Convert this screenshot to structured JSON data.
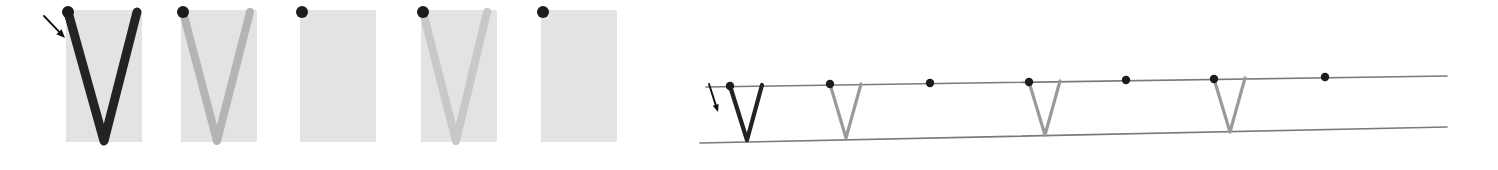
{
  "figure": {
    "caption": "",
    "background": "#ffffff",
    "width": 1498,
    "height": 170
  },
  "palette": {
    "panel_fill": "#e3e3e3",
    "dot_color": "#1c1c1c",
    "stroke_dark": "#232323",
    "stroke_mid": "#9a9a9a",
    "stroke_light": "#c3c3c3",
    "rail_color": "#7a7a7a",
    "arrow_color": "#111111"
  },
  "left_group": {
    "name": "square-panel-strip",
    "panel_count": 5,
    "panel_size": 76,
    "panel_top": 10,
    "panel_gap": 39,
    "panels": [
      {
        "index": 1,
        "x": 66,
        "y": 10,
        "w": 76,
        "h": 132,
        "fill": "#e3e3e3",
        "dot": {
          "cx": 68,
          "cy": 12,
          "r": 6
        },
        "v_shape": {
          "present": true,
          "color": "#232323",
          "width": 9,
          "left_x": 68,
          "right_x": 137,
          "apex_x": 104,
          "top_y": 12,
          "apex_y": 141
        },
        "label": "panel-1-dark-v"
      },
      {
        "index": 2,
        "x": 181,
        "y": 10,
        "w": 76,
        "h": 132,
        "fill": "#e3e3e3",
        "dot": {
          "cx": 183,
          "cy": 12,
          "r": 6
        },
        "v_shape": {
          "present": true,
          "color": "#b4b4b4",
          "width": 8,
          "left_x": 183,
          "right_x": 250,
          "apex_x": 217,
          "top_y": 12,
          "apex_y": 141
        },
        "label": "panel-2-grey-v"
      },
      {
        "index": 3,
        "x": 300,
        "y": 10,
        "w": 76,
        "h": 132,
        "fill": "#e3e3e3",
        "dot": {
          "cx": 302,
          "cy": 12,
          "r": 6
        },
        "v_shape": {
          "present": false
        },
        "label": "panel-3-empty"
      },
      {
        "index": 4,
        "x": 421,
        "y": 10,
        "w": 76,
        "h": 132,
        "fill": "#e3e3e3",
        "dot": {
          "cx": 423,
          "cy": 12,
          "r": 6
        },
        "v_shape": {
          "present": true,
          "color": "#c8c8c8",
          "width": 8,
          "left_x": 423,
          "right_x": 487,
          "apex_x": 456,
          "top_y": 12,
          "apex_y": 141
        },
        "label": "panel-4-light-v"
      },
      {
        "index": 5,
        "x": 541,
        "y": 10,
        "w": 76,
        "h": 132,
        "fill": "#e3e3e3",
        "dot": {
          "cx": 543,
          "cy": 12,
          "r": 6
        },
        "v_shape": {
          "present": false
        },
        "label": "panel-5-empty"
      }
    ],
    "arrow": {
      "name": "pointer-arrow-left",
      "from": {
        "x": 44,
        "y": 16
      },
      "to": {
        "x": 65,
        "y": 38
      },
      "head_size": 7,
      "color": "#111111"
    }
  },
  "right_group": {
    "name": "unrolled-strip-diagram",
    "top_rail": {
      "x1": 706,
      "y1": 87,
      "x2": 1447,
      "y2": 76
    },
    "bottom_rail": {
      "x1": 700,
      "y1": 143,
      "x2": 1447,
      "y2": 127
    },
    "rail_color": "#7a7a7a",
    "rail_width": 1.6,
    "dot_radius": 4.2,
    "dots": [
      {
        "index": 1,
        "cx": 730,
        "cy": 86
      },
      {
        "index": 2,
        "cx": 830,
        "cy": 84
      },
      {
        "index": 3,
        "cx": 930,
        "cy": 83
      },
      {
        "index": 4,
        "cx": 1029,
        "cy": 82
      },
      {
        "index": 5,
        "cx": 1126,
        "cy": 80
      },
      {
        "index": 6,
        "cx": 1214,
        "cy": 79
      },
      {
        "index": 7,
        "cx": 1325,
        "cy": 77
      }
    ],
    "v_shapes": [
      {
        "index": 1,
        "at_dot": 1,
        "color": "#232323",
        "width": 4.2,
        "left_x": 730,
        "left_y": 86,
        "apex_x": 747,
        "apex_y": 140,
        "right_x": 762,
        "right_y": 85
      },
      {
        "index": 2,
        "at_dot": 2,
        "color": "#9a9a9a",
        "width": 3.2,
        "left_x": 830,
        "left_y": 84,
        "apex_x": 846,
        "apex_y": 138,
        "right_x": 861,
        "right_y": 84
      },
      {
        "index": 3,
        "at_dot": 4,
        "color": "#9a9a9a",
        "width": 3.2,
        "left_x": 1029,
        "left_y": 82,
        "apex_x": 1045,
        "apex_y": 135,
        "right_x": 1060,
        "right_y": 81
      },
      {
        "index": 4,
        "at_dot": 6,
        "color": "#9a9a9a",
        "width": 3.2,
        "left_x": 1214,
        "left_y": 79,
        "apex_x": 1230,
        "apex_y": 132,
        "right_x": 1245,
        "right_y": 78
      }
    ],
    "arrow": {
      "name": "pointer-arrow-right",
      "from": {
        "x": 709,
        "y": 84
      },
      "to": {
        "x": 718,
        "y": 112
      },
      "head_size": 6,
      "color": "#111111"
    }
  }
}
